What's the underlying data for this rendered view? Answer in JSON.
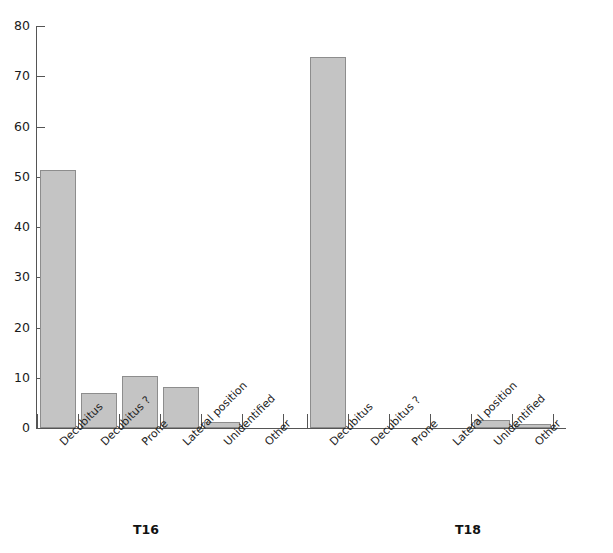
{
  "chart_data": {
    "type": "bar",
    "title": "",
    "subtitle": "",
    "xlabel": "",
    "ylabel": "",
    "ylim": [
      0,
      80
    ],
    "yticks": [
      0,
      10,
      20,
      30,
      40,
      50,
      60,
      70,
      80
    ],
    "ytick_labels": [
      "0",
      "10",
      "20",
      "30",
      "40",
      "50",
      "60",
      "70",
      "80"
    ],
    "grid": false,
    "legend": false,
    "legend_position": "none",
    "categories": [
      "Decubitus",
      "Decubitus ?",
      "Prone",
      "Lateral position",
      "Unidentified",
      "Other"
    ],
    "groups": [
      "T16",
      "T18"
    ],
    "series": [
      {
        "name": "T16",
        "values": [
          51.3,
          7.0,
          10.3,
          8.2,
          1.2,
          0
        ]
      },
      {
        "name": "T18",
        "values": [
          73.8,
          0,
          0,
          0,
          1.5,
          0.7
        ]
      }
    ]
  },
  "axis": {
    "y_labels": [
      "80",
      "70",
      "60",
      "50",
      "40",
      "30",
      "20",
      "10",
      "0"
    ]
  },
  "groups": [
    {
      "label": "T16",
      "categories": [
        "Decubitus",
        "Decubitus ?",
        "Prone",
        "Lateral position",
        "Unidentified",
        "Other"
      ],
      "values": [
        51.3,
        7.0,
        10.3,
        8.2,
        1.2,
        0
      ]
    },
    {
      "label": "T18",
      "categories": [
        "Decubitus",
        "Decubitus ?",
        "Prone",
        "Lateral position",
        "Unidentified",
        "Other"
      ],
      "values": [
        73.8,
        0,
        0,
        0,
        1.5,
        0.7
      ]
    }
  ],
  "colors": {
    "bar_fill": "#c4c4c4",
    "bar_stroke": "#8d8d8d",
    "axis": "#555555",
    "text": "#1a1a1a",
    "background": "#ffffff"
  }
}
